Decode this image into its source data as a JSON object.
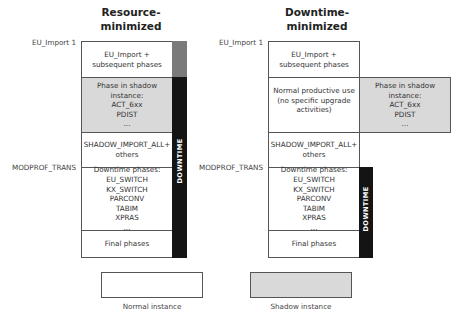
{
  "columns": [
    {
      "title": "Resource-\nminimized",
      "rows": [
        {
          "text": "EU_Import +\nsubsequent phases",
          "type": "normal"
        },
        {
          "text": "Phase in shadow\ninstance:\nACT_6xx\nPDIST\n...",
          "type": "shadow"
        },
        {
          "text": "SHADOW_IMPORT_ALL+\nothers",
          "type": "normal"
        },
        {
          "text": "Downtime phases:\nEU_SWITCH\nKX_SWITCH\nPARCONV\nTABIM\nXPRAS\n...",
          "type": "normal"
        },
        {
          "text": "Final phases",
          "type": "normal"
        }
      ],
      "downtime_label": "DOWNTIME"
    },
    {
      "title": "Downtime-\nminimized",
      "rows": [
        {
          "text": "EU_Import +\nsubsequent phases",
          "type": "normal"
        },
        {
          "text": "Normal productive use\n(no specific upgrade\nactivities)",
          "type": "normal"
        },
        {
          "text": "SHADOW_IMPORT_ALL+\nothers",
          "type": "normal"
        },
        {
          "text": "Downtime phases:\nEU_SWITCH\nKX_SWITCH\nPARCONV\nTABIM\nXPRAS\n...",
          "type": "normal"
        },
        {
          "text": "Final phases",
          "type": "normal"
        }
      ],
      "side_box": {
        "text": "Phase in shadow\ninstance:\nACT_6xx\nPDIST\n...",
        "type": "shadow"
      },
      "downtime_label": "DOWNTIME"
    }
  ],
  "side_labels": {
    "eu_import": "EU_Import 1",
    "modprof_trans": "MODPROF_TRANS"
  },
  "legend": {
    "normal": "Normal instance",
    "shadow": "Shadow instance"
  },
  "colors": {
    "normal_fill": "#ffffff",
    "shadow_fill": "#d9d9d9",
    "uptime_bar": "#7a7a7a",
    "downtime_bar": "#141414"
  }
}
